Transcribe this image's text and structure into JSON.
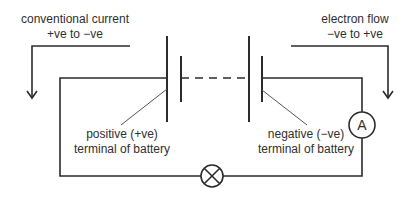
{
  "diagram": {
    "type": "circuit",
    "colors": {
      "wire": "#2b2b2b",
      "pointer": "#555555",
      "text": "#2f2f2f",
      "background": "#ffffff"
    },
    "labels": {
      "conventional_current_line1": "conventional current",
      "conventional_current_line2": "+ve to −ve",
      "electron_flow_line1": "electron flow",
      "electron_flow_line2": "−ve to +ve",
      "positive_terminal_line1": "positive (+ve)",
      "positive_terminal_line2": "terminal of battery",
      "negative_terminal_line1": "negative (−ve)",
      "negative_terminal_line2": "terminal of battery",
      "ammeter_symbol": "A"
    },
    "components": [
      {
        "name": "battery",
        "cells": 2,
        "note": "dashed link between cells"
      },
      {
        "name": "ammeter",
        "symbol": "A"
      },
      {
        "name": "lamp",
        "symbol": "crossed-circle"
      }
    ],
    "arrows": [
      {
        "name": "conventional-current-arrow",
        "direction": "down",
        "side": "left"
      },
      {
        "name": "electron-flow-arrow",
        "direction": "down",
        "side": "right"
      }
    ]
  }
}
